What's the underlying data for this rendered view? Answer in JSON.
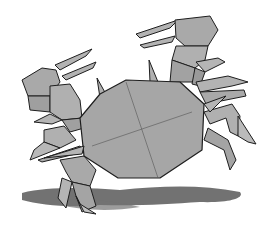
{
  "image": {
    "subject": "Origami crab illustration",
    "colors": {
      "paper": "#a9a9a9",
      "paper_light": "#b8b8b8",
      "paper_dark": "#8e8e8e",
      "outline": "#1e1e1e",
      "shadow": "#5a5a5a",
      "background": "#ffffff"
    }
  }
}
